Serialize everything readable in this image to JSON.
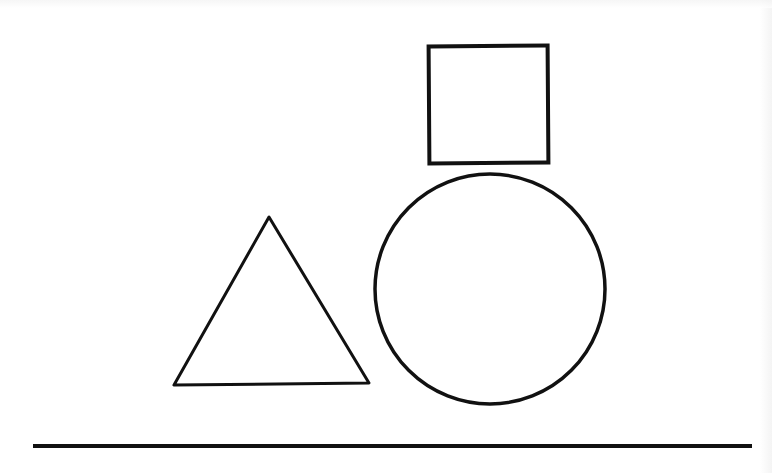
{
  "canvas": {
    "width": 772,
    "height": 473,
    "background": "#ffffff"
  },
  "shapes": {
    "square": {
      "type": "rect",
      "x": 429,
      "y": 46,
      "width": 119,
      "height": 117,
      "stroke": "#111111",
      "stroke_width": 4,
      "fill": "none"
    },
    "circle": {
      "type": "circle",
      "cx": 490,
      "cy": 289,
      "r": 115,
      "stroke": "#111111",
      "stroke_width": 3.5,
      "fill": "none"
    },
    "triangle": {
      "type": "triangle",
      "points": "269,217 174,385 369,383",
      "stroke": "#111111",
      "stroke_width": 3,
      "fill": "none"
    },
    "ground_line": {
      "type": "line",
      "x1": 33,
      "y1": 446,
      "x2": 752,
      "y2": 446,
      "stroke": "#111111",
      "stroke_width": 4
    }
  }
}
